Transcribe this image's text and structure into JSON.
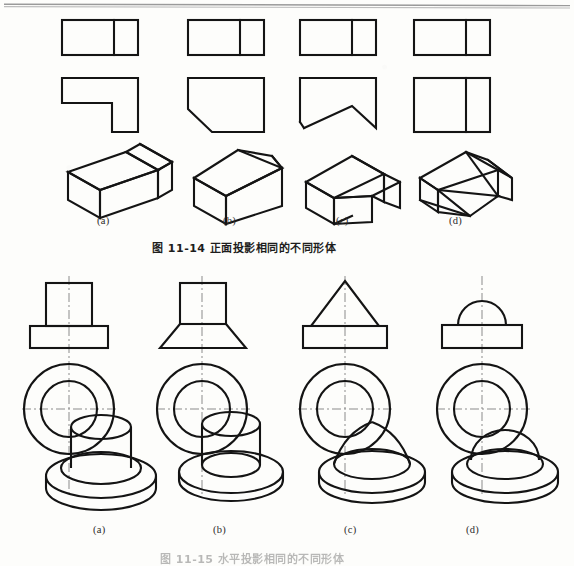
{
  "page": {
    "background_color": "#fdfdfb",
    "ink_color": "#141414",
    "centerline_color": "#8a8a8a",
    "rule_color": "#9a9a9a"
  },
  "figure_top": {
    "caption": "图 11-14    正面投影相同的不同形体",
    "caption_label": "图 11-14",
    "caption_title": "正面投影相同的不同形体",
    "part_labels": [
      "(a)",
      "(b)",
      "(c)",
      "(d)"
    ],
    "columns": [
      {
        "key": "a",
        "label": "(a)",
        "front_view": "rectangle with vertical dividing line",
        "top_view": "L-shaped outline",
        "pictorial": "L-shaped prism isometric"
      },
      {
        "key": "b",
        "label": "(b)",
        "front_view": "rectangle with vertical dividing line",
        "top_view": "rectangle with lower-left oblique cut",
        "pictorial": "wedge-cut prism isometric"
      },
      {
        "key": "c",
        "label": "(c)",
        "front_view": "rectangle with vertical dividing line",
        "top_view": "rectangle with V notch cut from bottom",
        "pictorial": "prism with inclined V surface isometric"
      },
      {
        "key": "d",
        "label": "(d)",
        "front_view": "rectangle with vertical dividing line",
        "top_view": "rectangle with vertical dividing line",
        "pictorial": "prism with two inclined planes isometric"
      }
    ]
  },
  "figure_bottom": {
    "caption": "图 11-15    水平投影相同的不同形体",
    "caption_visible": "partially cut off at page bottom edge",
    "part_labels": [
      "(a)",
      "(b)",
      "(c)",
      "(d)"
    ],
    "columns": [
      {
        "key": "a",
        "label": "(a)",
        "front_view": "cylinder on rectangular plate (T shape)",
        "top_view": "two concentric circles with centre lines",
        "pictorial": "cylinder on round disc"
      },
      {
        "key": "b",
        "label": "(b)",
        "front_view": "cylinder on truncated cone (frustum)",
        "top_view": "two concentric circles with centre lines",
        "pictorial": "cylinder on conical disc"
      },
      {
        "key": "c",
        "label": "(c)",
        "front_view": "triangle (cone) on rectangular plate",
        "top_view": "two concentric circles with centre lines",
        "pictorial": "cone on round disc"
      },
      {
        "key": "d",
        "label": "(d)",
        "front_view": "semicircle (hemisphere) on rectangular plate",
        "top_view": "two concentric circles with centre lines",
        "pictorial": "hemisphere on round disc"
      }
    ]
  }
}
